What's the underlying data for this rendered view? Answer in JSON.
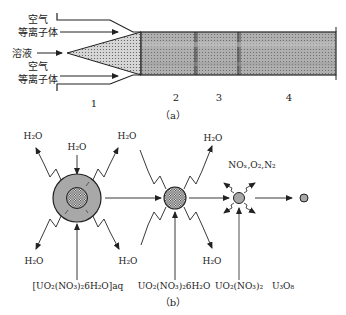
{
  "figure_a": {
    "caption": "（a）",
    "inputs": {
      "air_plasma_top_line1": "空气",
      "air_plasma_top_line2": "等离子体",
      "solution": "溶液",
      "air_plasma_bottom_line1": "空气",
      "air_plasma_bottom_line2": "等离子体"
    },
    "zones": [
      "1",
      "2",
      "3",
      "4"
    ]
  },
  "figure_b": {
    "caption": "（b）",
    "water_label": "H₂O",
    "gas_label": "NOₓ,O₂,N₂",
    "species": [
      "[UO₂(NO₃)₂6H₂O]aq",
      "UO₂(NO₃)₂6H₂O",
      "UO₂(NO₃)₂",
      "U₃O₈"
    ]
  },
  "colors": {
    "line": "#222222",
    "fill_gray": "#a8a8a8",
    "fill_zone": "#b5b5b5",
    "fill_cone": "#d9d9d9"
  }
}
